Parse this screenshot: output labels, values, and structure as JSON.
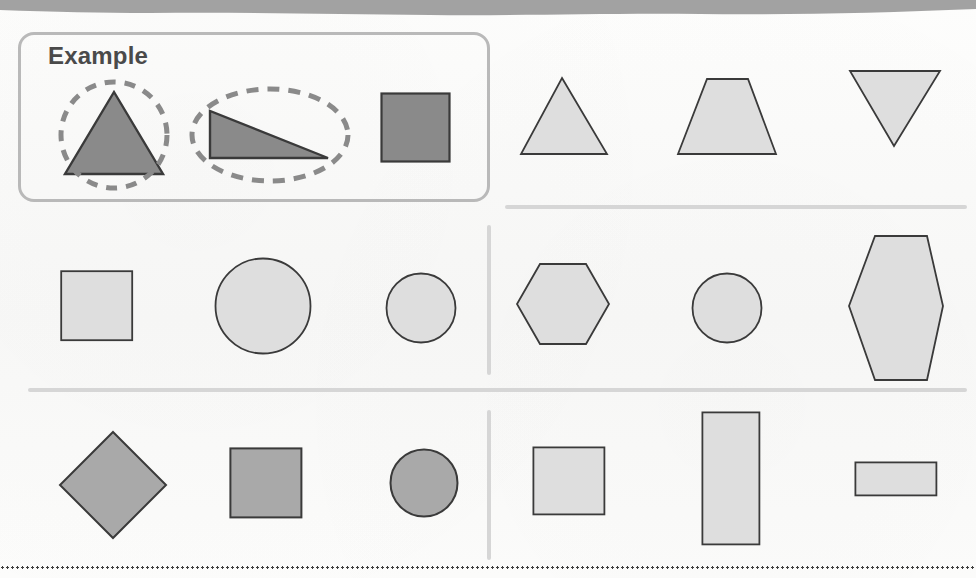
{
  "worksheet": {
    "title": "Shape Recognition Worksheet",
    "example_label": "Example",
    "paper_color": "#fbfbfa",
    "rule_color": "#d6d6d6",
    "box_border_color": "#b9b9b9",
    "annotation_color": "#8a8a8a",
    "outline_color": "#3a3a3a",
    "fill_dark": "#8a8a8a",
    "fill_medium": "#a9a9a9",
    "fill_light": "#dedede"
  },
  "top_band": {
    "name": "page-edge-band",
    "color": "#9a9a9a",
    "height": 16
  },
  "bottom_rule": {
    "name": "dotted-rule",
    "style": "dotted",
    "color": "#3c3c3c"
  },
  "dividers": [
    {
      "name": "divider-horizontal-top-right",
      "orientation": "horizontal",
      "x": 505,
      "y": 205,
      "length": 462
    },
    {
      "name": "divider-horizontal-middle",
      "orientation": "horizontal",
      "x": 28,
      "y": 388,
      "length": 939
    },
    {
      "name": "divider-vertical-row2",
      "orientation": "vertical",
      "x": 487,
      "y": 225,
      "length": 150
    },
    {
      "name": "divider-vertical-row3",
      "orientation": "vertical",
      "x": 487,
      "y": 410,
      "length": 150
    }
  ],
  "rows": [
    {
      "name": "row-example",
      "label": "Example",
      "boxed": true,
      "cells": [
        {
          "name": "shape-triangle-circled",
          "shape": "triangle",
          "fill": "#8a8a8a",
          "annotation": "dashed-circle",
          "x": 55,
          "y": 78,
          "w": 118,
          "h": 112
        },
        {
          "name": "shape-right-triangle-ellipsed",
          "shape": "right-triangle",
          "fill": "#8a8a8a",
          "annotation": "dashed-ellipse",
          "x": 190,
          "y": 78,
          "w": 160,
          "h": 112
        },
        {
          "name": "shape-square-dark",
          "shape": "square",
          "fill": "#8a8a8a",
          "annotation": "none",
          "x": 380,
          "y": 92,
          "w": 70,
          "h": 70
        }
      ]
    },
    {
      "name": "row-1-right",
      "boxed": false,
      "cells": [
        {
          "name": "shape-triangle-light",
          "shape": "triangle",
          "fill": "#dedede",
          "annotation": "none",
          "x": 517,
          "y": 75,
          "w": 92,
          "h": 82
        },
        {
          "name": "shape-trapezoid-light",
          "shape": "trapezoid",
          "fill": "#dedede",
          "annotation": "none",
          "x": 676,
          "y": 75,
          "w": 104,
          "h": 82
        },
        {
          "name": "shape-inverted-triangle-light",
          "shape": "inverted-triangle",
          "fill": "#dedede",
          "annotation": "none",
          "x": 846,
          "y": 70,
          "w": 96,
          "h": 80
        }
      ]
    },
    {
      "name": "row-2-left",
      "boxed": false,
      "cells": [
        {
          "name": "shape-square-light",
          "shape": "square",
          "fill": "#dedede",
          "annotation": "none",
          "x": 60,
          "y": 270,
          "w": 72,
          "h": 70
        },
        {
          "name": "shape-circle-large-light",
          "shape": "circle",
          "fill": "#dedede",
          "annotation": "none",
          "x": 215,
          "y": 258,
          "w": 96,
          "h": 96
        },
        {
          "name": "shape-circle-small-light",
          "shape": "circle",
          "fill": "#dedede",
          "annotation": "none",
          "x": 385,
          "y": 272,
          "w": 70,
          "h": 70
        }
      ]
    },
    {
      "name": "row-2-right",
      "boxed": false,
      "cells": [
        {
          "name": "shape-hexagon-light",
          "shape": "hexagon",
          "fill": "#dedede",
          "annotation": "none",
          "x": 515,
          "y": 262,
          "w": 96,
          "h": 84
        },
        {
          "name": "shape-circle-medium-light",
          "shape": "circle",
          "fill": "#dedede",
          "annotation": "none",
          "x": 691,
          "y": 272,
          "w": 70,
          "h": 70
        },
        {
          "name": "shape-hexagon-tall-light",
          "shape": "hexagon-vertical",
          "fill": "#dedede",
          "annotation": "none",
          "x": 845,
          "y": 235,
          "w": 100,
          "h": 145
        }
      ]
    },
    {
      "name": "row-3-left",
      "boxed": false,
      "cells": [
        {
          "name": "shape-diamond-medium",
          "shape": "diamond",
          "fill": "#a9a9a9",
          "annotation": "none",
          "x": 58,
          "y": 430,
          "w": 108,
          "h": 108
        },
        {
          "name": "shape-square-medium",
          "shape": "square",
          "fill": "#a9a9a9",
          "annotation": "none",
          "x": 230,
          "y": 448,
          "w": 72,
          "h": 70
        },
        {
          "name": "shape-circle-medium",
          "shape": "circle",
          "fill": "#a9a9a9",
          "annotation": "none",
          "x": 389,
          "y": 448,
          "w": 66,
          "h": 66
        }
      ]
    },
    {
      "name": "row-3-right",
      "boxed": false,
      "cells": [
        {
          "name": "shape-square-light-2",
          "shape": "square",
          "fill": "#dedede",
          "annotation": "none",
          "x": 533,
          "y": 447,
          "w": 72,
          "h": 68
        },
        {
          "name": "shape-rectangle-tall-light",
          "shape": "rectangle",
          "fill": "#dedede",
          "annotation": "none",
          "x": 702,
          "y": 412,
          "w": 58,
          "h": 133
        },
        {
          "name": "shape-rectangle-wide-light",
          "shape": "rectangle",
          "fill": "#dedede",
          "annotation": "none",
          "x": 855,
          "y": 462,
          "w": 82,
          "h": 34
        }
      ]
    }
  ]
}
